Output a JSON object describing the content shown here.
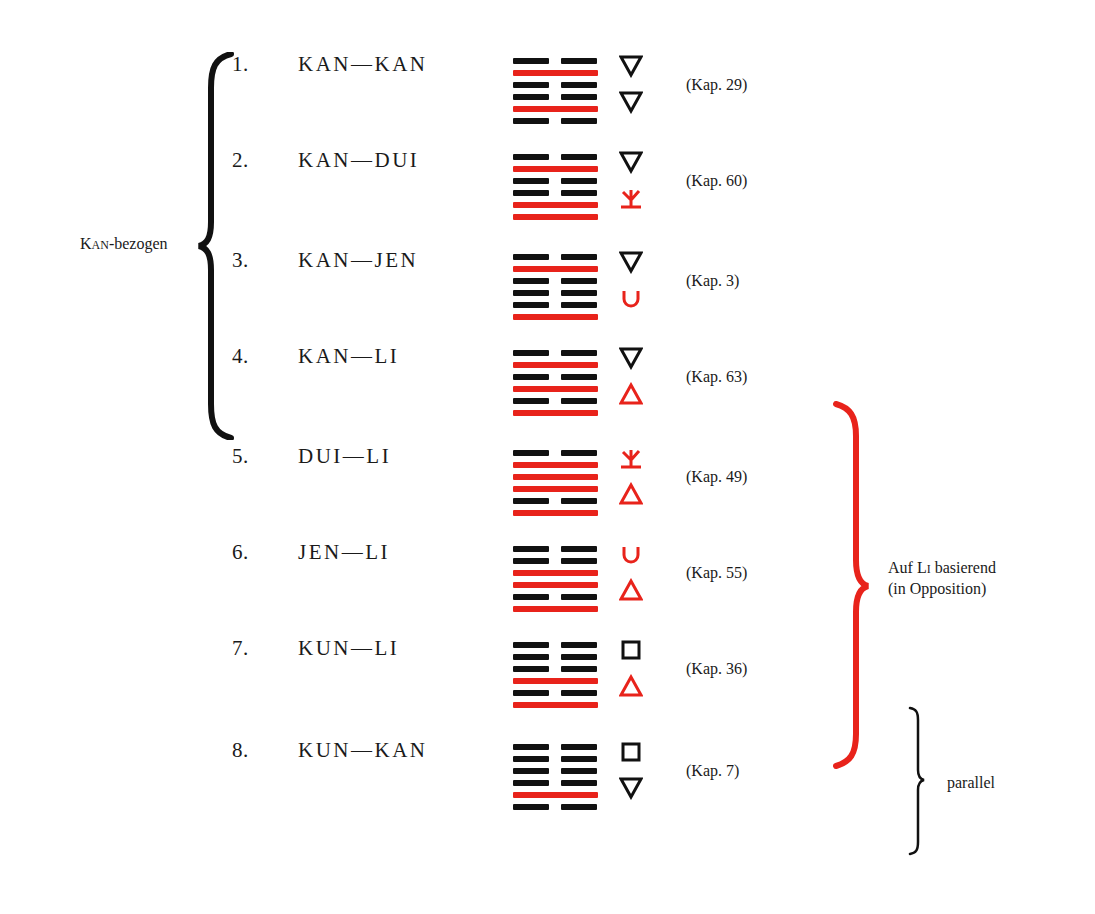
{
  "colors": {
    "red": "#e8231b",
    "black": "#111111"
  },
  "rows": [
    {
      "num": "1.",
      "name": "KAN—KAN",
      "kap": "(Kap. 29)",
      "lines": [
        [
          "b",
          "k"
        ],
        [
          "s",
          "r"
        ],
        [
          "b",
          "k"
        ],
        [
          "b",
          "k"
        ],
        [
          "s",
          "r"
        ],
        [
          "b",
          "k"
        ]
      ],
      "symbols": [
        [
          "triangle-down",
          "k"
        ],
        [
          "triangle-down",
          "k"
        ]
      ]
    },
    {
      "num": "2.",
      "name": "KAN—DUI",
      "kap": "(Kap. 60)",
      "lines": [
        [
          "b",
          "k"
        ],
        [
          "s",
          "r"
        ],
        [
          "b",
          "k"
        ],
        [
          "b",
          "k"
        ],
        [
          "s",
          "r"
        ],
        [
          "s",
          "r"
        ]
      ],
      "symbols": [
        [
          "triangle-down",
          "k"
        ],
        [
          "dui",
          "r"
        ]
      ]
    },
    {
      "num": "3.",
      "name": "KAN—JEN",
      "kap": "(Kap. 3)",
      "lines": [
        [
          "b",
          "k"
        ],
        [
          "s",
          "r"
        ],
        [
          "b",
          "k"
        ],
        [
          "b",
          "k"
        ],
        [
          "b",
          "k"
        ],
        [
          "s",
          "r"
        ]
      ],
      "symbols": [
        [
          "triangle-down",
          "k"
        ],
        [
          "cup",
          "r"
        ]
      ]
    },
    {
      "num": "4.",
      "name": "KAN—LI",
      "kap": "(Kap. 63)",
      "lines": [
        [
          "b",
          "k"
        ],
        [
          "s",
          "r"
        ],
        [
          "b",
          "k"
        ],
        [
          "s",
          "r"
        ],
        [
          "b",
          "k"
        ],
        [
          "s",
          "r"
        ]
      ],
      "symbols": [
        [
          "triangle-down",
          "k"
        ],
        [
          "triangle-up",
          "r"
        ]
      ]
    },
    {
      "num": "5.",
      "name": "DUI—LI",
      "kap": "(Kap. 49)",
      "lines": [
        [
          "b",
          "k"
        ],
        [
          "s",
          "r"
        ],
        [
          "s",
          "r"
        ],
        [
          "s",
          "r"
        ],
        [
          "b",
          "k"
        ],
        [
          "s",
          "r"
        ]
      ],
      "symbols": [
        [
          "dui",
          "r"
        ],
        [
          "triangle-up",
          "r"
        ]
      ]
    },
    {
      "num": "6.",
      "name": "JEN—LI",
      "kap": "(Kap. 55)",
      "lines": [
        [
          "b",
          "k"
        ],
        [
          "b",
          "k"
        ],
        [
          "s",
          "r"
        ],
        [
          "s",
          "r"
        ],
        [
          "b",
          "k"
        ],
        [
          "s",
          "r"
        ]
      ],
      "symbols": [
        [
          "cup",
          "r"
        ],
        [
          "triangle-up",
          "r"
        ]
      ]
    },
    {
      "num": "7.",
      "name": "KUN—LI",
      "kap": "(Kap. 36)",
      "lines": [
        [
          "b",
          "k"
        ],
        [
          "b",
          "k"
        ],
        [
          "b",
          "k"
        ],
        [
          "s",
          "r"
        ],
        [
          "b",
          "k"
        ],
        [
          "s",
          "r"
        ]
      ],
      "symbols": [
        [
          "square",
          "k"
        ],
        [
          "triangle-up",
          "r"
        ]
      ]
    },
    {
      "num": "8.",
      "name": "KUN—KAN",
      "kap": "(Kap. 7)",
      "lines": [
        [
          "b",
          "k"
        ],
        [
          "b",
          "k"
        ],
        [
          "b",
          "k"
        ],
        [
          "b",
          "k"
        ],
        [
          "s",
          "r"
        ],
        [
          "b",
          "k"
        ]
      ],
      "symbols": [
        [
          "square",
          "k"
        ],
        [
          "triangle-down",
          "k"
        ]
      ]
    }
  ],
  "groups": {
    "kan": {
      "label_prefix": "K",
      "label_smallcaps": "AN",
      "label_suffix": "-bezogen"
    },
    "li": {
      "line1_prefix": "Auf L",
      "line1_smallcaps": "I",
      "line1_suffix": " basierend",
      "line2": "(in Opposition)"
    },
    "parallel": {
      "label": "parallel"
    }
  }
}
